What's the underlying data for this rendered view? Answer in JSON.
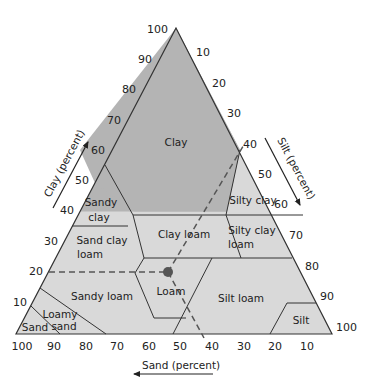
{
  "diagram": {
    "colors": {
      "clay_fill": "#b4b4b4",
      "region_fill": "#d9d9d9",
      "stroke": "#333333",
      "dashed": "#555555",
      "point": "#555555"
    },
    "axes": {
      "clay": {
        "label": "Clay (percent)",
        "ticks": [
          "10",
          "20",
          "30",
          "40",
          "50",
          "60",
          "70",
          "80",
          "90",
          "100"
        ]
      },
      "silt": {
        "label": "Silt (percent)",
        "ticks": [
          "10",
          "20",
          "30",
          "40",
          "50",
          "60",
          "70",
          "80",
          "90",
          "100"
        ]
      },
      "sand": {
        "label": "Sand (percent)",
        "ticks": [
          "100",
          "90",
          "80",
          "70",
          "60",
          "50",
          "40",
          "30",
          "20",
          "10"
        ]
      }
    },
    "regions": [
      {
        "id": "clay",
        "lines": [
          "Clay"
        ]
      },
      {
        "id": "sandy-clay",
        "lines": [
          "Sandy",
          "clay"
        ]
      },
      {
        "id": "silty-clay",
        "lines": [
          "Silty clay"
        ]
      },
      {
        "id": "sand-clay-loam",
        "lines": [
          "Sand clay",
          "loam"
        ]
      },
      {
        "id": "clay-loam",
        "lines": [
          "Clay loam"
        ]
      },
      {
        "id": "silty-clay-loam",
        "lines": [
          "Silty clay",
          "loam"
        ]
      },
      {
        "id": "sandy-loam",
        "lines": [
          "Sandy loam"
        ]
      },
      {
        "id": "loam",
        "lines": [
          "Loam"
        ]
      },
      {
        "id": "silt-loam",
        "lines": [
          "Silt loam"
        ]
      },
      {
        "id": "silt",
        "lines": [
          "Silt"
        ]
      },
      {
        "id": "loamy-sand",
        "lines": [
          "Loamy",
          "sand"
        ]
      },
      {
        "id": "sand",
        "lines": [
          "Sand"
        ]
      }
    ],
    "example_point": {
      "clay_percent": 20,
      "silt_percent": 40,
      "sand_percent": 40,
      "classification": "Loam"
    }
  }
}
